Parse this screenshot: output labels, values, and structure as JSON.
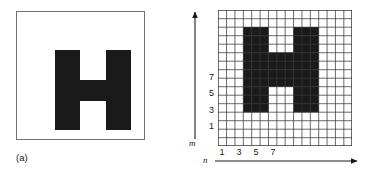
{
  "figure": {
    "background_color": "#ffffff",
    "ink_color": "#1a1a1a",
    "frame_color": "#6f7174",
    "grid_line_color": "#3a3a3a"
  },
  "panel_a": {
    "caption": "(a)",
    "frame": {
      "label": "image-frame"
    },
    "glyph": {
      "character": "H",
      "name": "letter-h-shape"
    }
  },
  "panel_b": {
    "caption": "(b)",
    "axes": {
      "vertical": {
        "label": "m",
        "arrow": "up-arrow-icon"
      },
      "horizontal": {
        "label": "n",
        "arrow": "right-arrow-icon"
      }
    },
    "y_ticks": [
      "7",
      "5",
      "3",
      "1"
    ],
    "x_ticks": [
      "1",
      "3",
      "5",
      "7"
    ],
    "grid": {
      "columns": 16,
      "rows": 16
    },
    "glyph": {
      "character": "H",
      "name": "letter-h-pixelated"
    }
  },
  "chart_data": {
    "type": "heatmap",
    "xlabel": "n",
    "ylabel": "m",
    "grid": true,
    "legend": "none",
    "columns": 16,
    "rows": 16,
    "xlim": [
      1,
      16
    ],
    "ylim": [
      1,
      16
    ],
    "x_tick_values": [
      1,
      3,
      5,
      7
    ],
    "y_tick_values": [
      1,
      3,
      5,
      7
    ],
    "x_tick_labels": [
      "1",
      "3",
      "5",
      "7"
    ],
    "y_tick_labels": [
      "1",
      "3",
      "5",
      "7"
    ],
    "value_labels": {
      "0": "white / background",
      "1": "black / object pixel"
    },
    "matrix_top_to_bottom": [
      [
        0,
        0,
        0,
        0,
        0,
        0,
        0,
        0,
        0,
        0,
        0,
        0,
        0,
        0,
        0,
        0
      ],
      [
        0,
        0,
        0,
        0,
        0,
        0,
        0,
        0,
        0,
        0,
        0,
        0,
        0,
        0,
        0,
        0
      ],
      [
        0,
        0,
        0,
        1,
        1,
        1,
        0,
        0,
        0,
        1,
        1,
        1,
        0,
        0,
        0,
        0
      ],
      [
        0,
        0,
        0,
        1,
        1,
        1,
        0,
        0,
        0,
        1,
        1,
        1,
        0,
        0,
        0,
        0
      ],
      [
        0,
        0,
        0,
        1,
        1,
        1,
        0,
        0,
        0,
        1,
        1,
        1,
        0,
        0,
        0,
        0
      ],
      [
        0,
        0,
        0,
        1,
        1,
        1,
        1,
        1,
        1,
        1,
        1,
        1,
        0,
        0,
        0,
        0
      ],
      [
        0,
        0,
        0,
        1,
        1,
        1,
        1,
        1,
        1,
        1,
        1,
        1,
        0,
        0,
        0,
        0
      ],
      [
        0,
        0,
        0,
        1,
        1,
        1,
        1,
        1,
        1,
        1,
        1,
        1,
        0,
        0,
        0,
        0
      ],
      [
        0,
        0,
        0,
        1,
        1,
        1,
        1,
        1,
        1,
        1,
        1,
        1,
        0,
        0,
        0,
        0
      ],
      [
        0,
        0,
        0,
        1,
        1,
        1,
        0,
        0,
        0,
        1,
        1,
        1,
        0,
        0,
        0,
        0
      ],
      [
        0,
        0,
        0,
        1,
        1,
        1,
        0,
        0,
        0,
        1,
        1,
        1,
        0,
        0,
        0,
        0
      ],
      [
        0,
        0,
        0,
        1,
        1,
        1,
        0,
        0,
        0,
        1,
        1,
        1,
        0,
        0,
        0,
        0
      ],
      [
        0,
        0,
        0,
        0,
        0,
        0,
        0,
        0,
        0,
        0,
        0,
        0,
        0,
        0,
        0,
        0
      ],
      [
        0,
        0,
        0,
        0,
        0,
        0,
        0,
        0,
        0,
        0,
        0,
        0,
        0,
        0,
        0,
        0
      ],
      [
        0,
        0,
        0,
        0,
        0,
        0,
        0,
        0,
        0,
        0,
        0,
        0,
        0,
        0,
        0,
        0
      ],
      [
        0,
        0,
        0,
        0,
        0,
        0,
        0,
        0,
        0,
        0,
        0,
        0,
        0,
        0,
        0,
        0
      ]
    ]
  }
}
